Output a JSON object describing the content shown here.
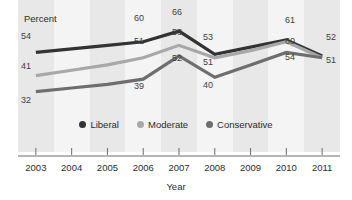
{
  "chart_data": {
    "type": "line",
    "title": "",
    "subtitle": "",
    "xlabel": "Year",
    "ylabel": "Percent",
    "ylim": [
      25,
      70
    ],
    "xlim": [
      2003,
      2011
    ],
    "grid": false,
    "legend_position": "inside-bottom-center",
    "x": [
      "2003",
      "2004",
      "2005",
      "2006",
      "2007",
      "2008",
      "2009",
      "2010",
      "2011"
    ],
    "categories": [
      "2003",
      "2004",
      "2005",
      "2006",
      "2007",
      "2008",
      "2009",
      "2010",
      "2011"
    ],
    "series": [
      {
        "name": "Liberal",
        "color": "#333333",
        "values": [
          54,
          56,
          58,
          60,
          66,
          53,
          57,
          61,
          52
        ],
        "labeled_points": [
          {
            "x": "2003",
            "value": 54
          },
          {
            "x": "2006",
            "value": 60
          },
          {
            "x": "2007",
            "value": 66
          },
          {
            "x": "2008",
            "value": 53
          },
          {
            "x": "2010",
            "value": 61
          },
          {
            "x": "2011",
            "value": 52
          }
        ]
      },
      {
        "name": "Moderate",
        "color": "#a8a8a8",
        "values": [
          41,
          44,
          47,
          51,
          58,
          51,
          55,
          60,
          51
        ],
        "labeled_points": [
          {
            "x": "2003",
            "value": 41
          },
          {
            "x": "2006",
            "value": 51
          },
          {
            "x": "2007",
            "value": 58
          },
          {
            "x": "2008",
            "value": 51
          },
          {
            "x": "2010",
            "value": 60
          },
          {
            "x": "2011",
            "value": 51
          }
        ]
      },
      {
        "name": "Conservative",
        "color": "#6e6e6e",
        "values": [
          32,
          34,
          36,
          39,
          52,
          40,
          47,
          54,
          51
        ],
        "labeled_points": [
          {
            "x": "2003",
            "value": 32
          },
          {
            "x": "2006",
            "value": 39
          },
          {
            "x": "2007",
            "value": 52
          },
          {
            "x": "2008",
            "value": 40
          },
          {
            "x": "2010",
            "value": 54
          },
          {
            "x": "2011",
            "value": 51
          }
        ]
      }
    ],
    "tick_labels_x": [
      "2003",
      "2004",
      "2005",
      "2006",
      "2007",
      "2008",
      "2009",
      "2010",
      "2011"
    ],
    "tick_labels_y": [],
    "annotations": [
      "Percent"
    ]
  },
  "axis": {
    "y_axis_title": "Percent",
    "x_axis_title": "Year",
    "ticks": [
      "2003",
      "2004",
      "2005",
      "2006",
      "2007",
      "2008",
      "2009",
      "2010",
      "2011"
    ]
  },
  "legend": {
    "items": [
      {
        "label": "Liberal",
        "color": "#333333"
      },
      {
        "label": "Moderate",
        "color": "#a8a8a8"
      },
      {
        "label": "Conservative",
        "color": "#6e6e6e"
      }
    ]
  },
  "value_labels": {
    "liberal": {
      "y2003": "54",
      "y2006": "60",
      "y2007": "66",
      "y2008": "53",
      "y2010": "61",
      "y2011": "52"
    },
    "moderate": {
      "y2003": "41",
      "y2006": "51",
      "y2007": "58",
      "y2008": "51",
      "y2010": "60",
      "y2011": "51"
    },
    "conservative": {
      "y2003": "32",
      "y2006": "39",
      "y2007": "52",
      "y2008": "40",
      "y2010": "54",
      "y2011": "51"
    }
  },
  "colors": {
    "liberal": "#333333",
    "moderate": "#a8a8a8",
    "conservative": "#6e6e6e",
    "band_dark": "#e8e8e8",
    "band_light": "#f4f4f4",
    "axis": "#6b6b6b",
    "text": "#2b2b2b"
  }
}
